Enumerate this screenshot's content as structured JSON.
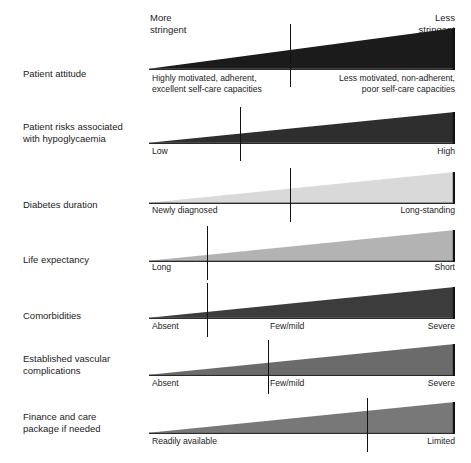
{
  "figure": {
    "width": 471,
    "height": 463,
    "background": "#ffffff"
  },
  "header": {
    "left_caption": "More\nstringent",
    "right_caption": "Less\nstringent"
  },
  "chart_data": {
    "type": "bar",
    "title": "",
    "xlabel": "",
    "ylabel": "",
    "categories": [
      "Patient attitude",
      "Patient risks associated with hypoglycaemia",
      "Diabetes duration",
      "Life expectancy",
      "Comorbidities",
      "Established vascular complications",
      "Finance and care package if needed"
    ],
    "axis_poles": [
      "More stringent",
      "Less stringent"
    ],
    "series": [
      {
        "name": "wedge marker position (0=more stringent, 1=less stringent)",
        "values": [
          0.46,
          0.3,
          0.46,
          0.19,
          0.19,
          0.39,
          0.71
        ]
      }
    ],
    "grid": false,
    "legend": "none"
  },
  "rows": [
    {
      "id": "patient-attitude",
      "label": "Patient attitude",
      "top": 28,
      "label_top": 68,
      "wedge_top": 28,
      "wedge_height": 42,
      "fill": "#1b1b1b",
      "marker_x": 141,
      "marker_top": 24,
      "marker_height": 63,
      "caption_top": 73,
      "caption_left": "Highly motivated, adherent,\nexcellent self-care capacities",
      "caption_right": "Less motivated, non-adherent,\npoor self-care capacities",
      "start_label": "",
      "mid_label": "",
      "end_label": ""
    },
    {
      "id": "patient-risks-hypoglycaemia",
      "label": "Patient risks associated\nwith hypoglycaemia",
      "top": 112,
      "label_top": 121,
      "wedge_top": 112,
      "wedge_height": 32,
      "fill": "#2e2e2e",
      "marker_x": 91,
      "marker_top": 107,
      "marker_height": 54,
      "caption_top": 146,
      "start_label": "Low",
      "mid_label": "",
      "end_label": "High"
    },
    {
      "id": "diabetes-duration",
      "label": "Diabetes duration",
      "top": 172,
      "label_top": 199,
      "wedge_top": 172,
      "wedge_height": 32,
      "fill": "#d9d9d9",
      "marker_x": 141,
      "marker_top": 168,
      "marker_height": 54,
      "caption_top": 205,
      "start_label": "Newly diagnosed",
      "mid_label": "",
      "end_label": "Long-standing"
    },
    {
      "id": "life-expectancy",
      "label": "Life expectancy",
      "top": 230,
      "label_top": 254,
      "wedge_top": 230,
      "wedge_height": 32,
      "fill": "#b3b3b3",
      "marker_x": 58,
      "marker_top": 226,
      "marker_height": 54,
      "caption_top": 262,
      "start_label": "Long",
      "mid_label": "",
      "end_label": "Short"
    },
    {
      "id": "comorbidities",
      "label": "Comorbidities",
      "top": 287,
      "label_top": 310,
      "wedge_top": 287,
      "wedge_height": 32,
      "fill": "#3c3c3c",
      "marker_x": 58,
      "marker_top": 283,
      "marker_height": 54,
      "caption_top": 321,
      "start_label": "Absent",
      "mid_label": "Few/mild",
      "end_label": "Severe"
    },
    {
      "id": "established-vascular-complications",
      "label": "Established vascular\ncomplications",
      "top": 344,
      "label_top": 353,
      "wedge_top": 344,
      "wedge_height": 32,
      "fill": "#6b6b6b",
      "marker_x": 119,
      "marker_top": 340,
      "marker_height": 54,
      "caption_top": 378,
      "start_label": "Absent",
      "mid_label": "Few/mild",
      "end_label": "Severe"
    },
    {
      "id": "finance-and-care-package",
      "label": "Finance and care\npackage if needed",
      "top": 402,
      "label_top": 411,
      "wedge_top": 402,
      "wedge_height": 32,
      "fill": "#787878",
      "marker_x": 218,
      "marker_top": 398,
      "marker_height": 54,
      "caption_top": 436,
      "start_label": "Readily available",
      "mid_label": "",
      "end_label": "Limited"
    }
  ],
  "colors": {
    "text": "#1c1c1c",
    "marker": "#111111",
    "background": "#ffffff"
  }
}
